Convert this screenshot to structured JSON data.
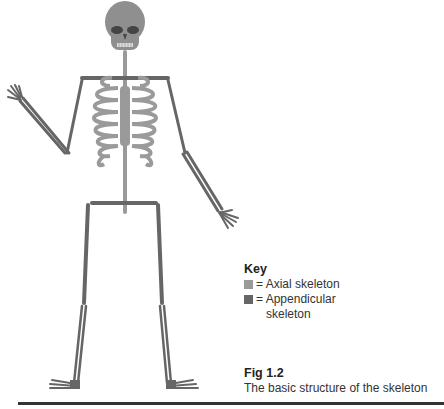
{
  "figure": {
    "label": "Fig 1.2",
    "caption": "The basic structure of the skeleton"
  },
  "key": {
    "title": "Key",
    "items": [
      {
        "label": "= Axial skeleton",
        "color": "#9a9a9a"
      },
      {
        "label": "= Appendicular",
        "label2": "skeleton",
        "color": "#666666"
      }
    ]
  },
  "colors": {
    "axial": "#9a9a9a",
    "appendicular": "#666666",
    "skull": "#8f8f8f",
    "outline": "#555555"
  }
}
